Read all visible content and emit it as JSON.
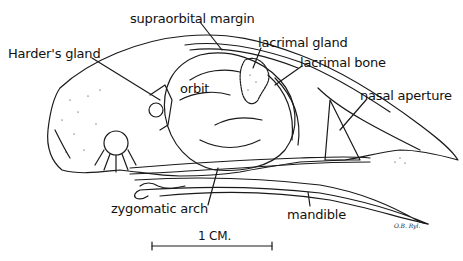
{
  "diagram": {
    "labels": {
      "supraorbital_margin": "supraorbital margin",
      "harders_gland": "Harder's gland",
      "lacrimal_gland": "lacrimal gland",
      "lacrimal_bone": "lacrimal bone",
      "orbit": "orbit",
      "nasal_aperture": "nasal aperture",
      "zygomatic_arch": "zygomatic arch",
      "mandible": "mandible"
    },
    "scale_bar": {
      "label": "1 CM."
    },
    "signature": "O.B. Ryl."
  },
  "colors": {
    "ink": "#1a1a1a",
    "background": "#ffffff"
  }
}
